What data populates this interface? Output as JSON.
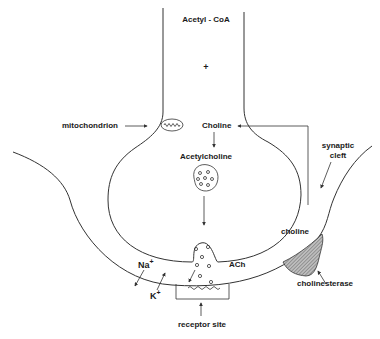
{
  "diagram": {
    "labels": {
      "acetyl_coa": "Acetyl - CoA",
      "plus": "+",
      "mitochondrion": "mitochondrion",
      "choline_top": "Choline",
      "acetylcholine": "Acetylcholine",
      "synaptic_cleft_line1": "synaptic",
      "synaptic_cleft_line2": "cleft",
      "choline_cleft": "choline",
      "ach": "ACh",
      "na": "Na",
      "na_charge": "+",
      "k": "K",
      "k_charge": "+",
      "cholinesterase": "cholinesterase",
      "receptor_site": "receptor site"
    },
    "colors": {
      "stroke": "#333333",
      "text": "#1a1a1a",
      "background": "#ffffff",
      "cholinesterase_fill": "#9a9a9a"
    }
  }
}
